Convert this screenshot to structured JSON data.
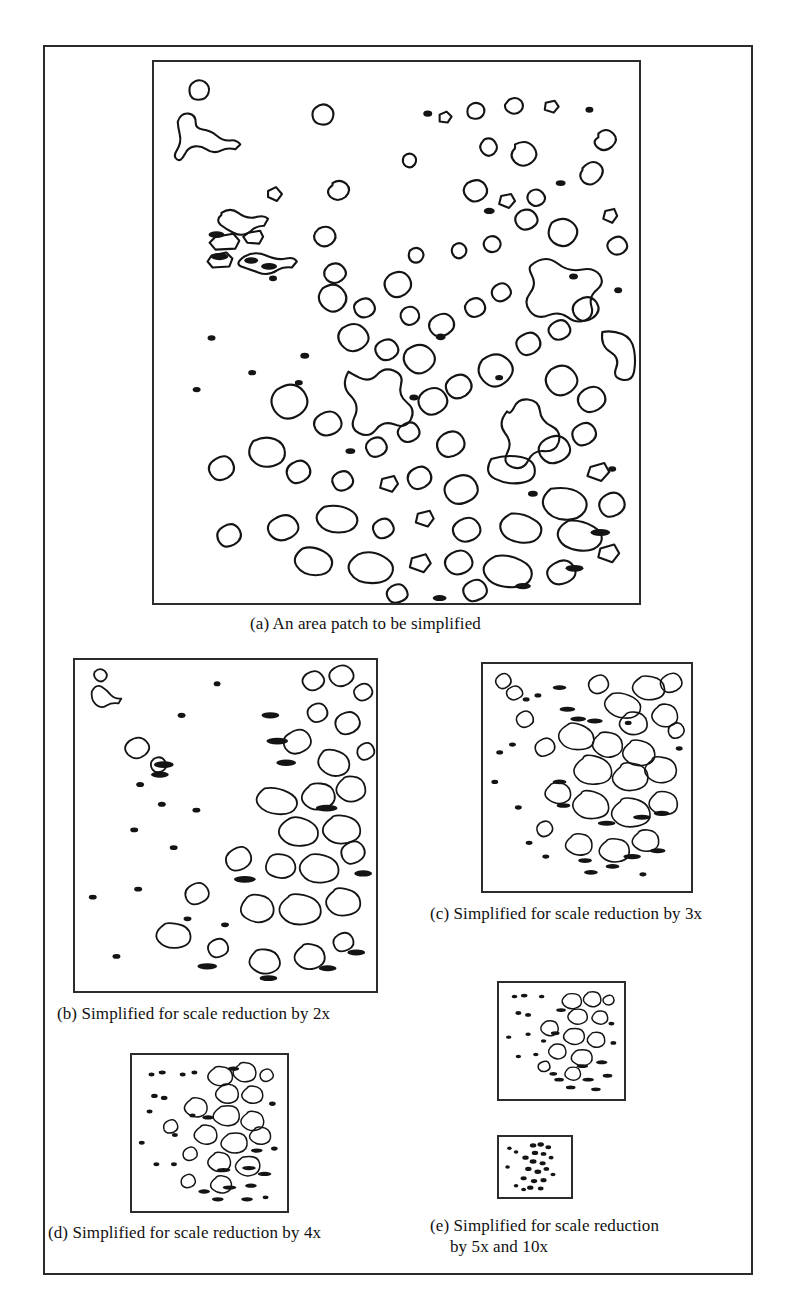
{
  "figure": {
    "type": "document-figure",
    "border_color": "#2b2b2b",
    "ink_color": "#1a1a1a",
    "background_color": "#ffffff"
  },
  "panels": [
    {
      "id": "a",
      "caption": "(a) An area patch to be simplified",
      "caption_lines": [
        "(a) An area patch to be simplified"
      ],
      "scale_reduction": "1x",
      "box": {
        "x": 152,
        "y": 60,
        "w": 489,
        "h": 545
      },
      "polygon_count": 118,
      "detail_level": 1.0
    },
    {
      "id": "b",
      "caption": "(b) Simplified for scale reduction by 2x",
      "caption_lines": [
        "(b) Simplified for scale reduction by 2x"
      ],
      "scale_reduction": "2x",
      "box": {
        "x": 73,
        "y": 658,
        "w": 305,
        "h": 335
      },
      "polygon_count": 96,
      "detail_level": 0.62
    },
    {
      "id": "c",
      "caption": "(c) Simplified for scale reduction by 3x",
      "caption_lines": [
        "(c) Simplified for scale reduction by 3x"
      ],
      "scale_reduction": "3x",
      "box": {
        "x": 481,
        "y": 662,
        "w": 212,
        "h": 231
      },
      "polygon_count": 84,
      "detail_level": 0.43
    },
    {
      "id": "d",
      "caption": "(d) Simplified for scale reduction by 4x",
      "caption_lines": [
        "(d) Simplified for scale reduction by 4x"
      ],
      "scale_reduction": "4x",
      "box": {
        "x": 130,
        "y": 1053,
        "w": 159,
        "h": 160
      },
      "polygon_count": 70,
      "detail_level": 0.33
    },
    {
      "id": "e5",
      "caption": "(e) Simplified for scale reduction by 5x and 10x",
      "caption_lines": [
        "(e) Simplified for scale reduction",
        "by 5x and 10x"
      ],
      "scale_reduction": "5x",
      "box": {
        "x": 497,
        "y": 981,
        "w": 129,
        "h": 120
      },
      "polygon_count": 60,
      "detail_level": 0.25
    },
    {
      "id": "e10",
      "caption": "",
      "caption_lines": [],
      "scale_reduction": "10x",
      "box": {
        "x": 497,
        "y": 1135,
        "w": 76,
        "h": 64
      },
      "polygon_count": 42,
      "detail_level": 0.13
    }
  ],
  "captions": {
    "a": "(a) An area patch to be simplified",
    "b": "(b) Simplified for scale reduction by 2x",
    "c": "(c) Simplified for scale reduction by 3x",
    "d": "(d) Simplified for scale reduction by 4x",
    "e_line1": "(e) Simplified for scale reduction",
    "e_line2": "by 5x and 10x"
  }
}
